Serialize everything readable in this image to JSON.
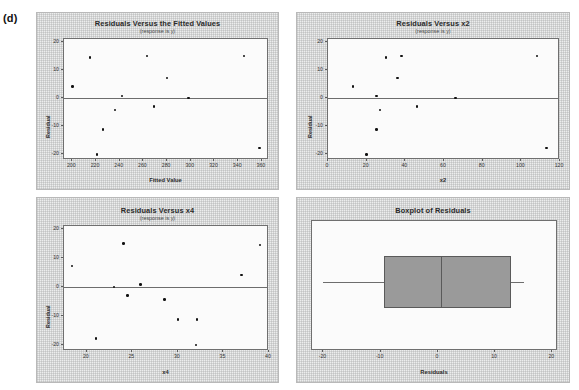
{
  "figure": {
    "label": "(d)"
  },
  "panels": [
    {
      "name": "residuals-vs-fitted",
      "title": "Residuals Versus the Fitted Values",
      "subtitle": "(response is y)",
      "xlabel": "Fitted Value",
      "ylabel": "Residual"
    },
    {
      "name": "residuals-vs-x2",
      "title": "Residuals Versus x2",
      "subtitle": "(response is y)",
      "xlabel": "x2",
      "ylabel": "Residual"
    },
    {
      "name": "residuals-vs-x4",
      "title": "Residuals Versus x4",
      "subtitle": "(response is y)",
      "xlabel": "x4",
      "ylabel": "Residual"
    },
    {
      "name": "boxplot-residuals",
      "title": "Boxplot of Residuals",
      "subtitle": "",
      "xlabel": "Residuals",
      "ylabel": ""
    }
  ],
  "chart_data": [
    {
      "type": "scatter",
      "title": "Residuals Versus the Fitted Values",
      "subtitle": "(response is y)",
      "xlabel": "Fitted Value",
      "ylabel": "Residual",
      "xlim": [
        193,
        366
      ],
      "ylim": [
        -22,
        21
      ],
      "xticks": [
        200,
        220,
        240,
        260,
        280,
        300,
        320,
        340,
        360
      ],
      "yticks": [
        -20,
        -10,
        0,
        10,
        20
      ],
      "grid": false,
      "reference_line": 0,
      "x": [
        200,
        215,
        221,
        226,
        236,
        242,
        263,
        269,
        280,
        298,
        345,
        358
      ],
      "y": [
        4.2,
        14.5,
        -20.0,
        -11.2,
        -4.3,
        0.8,
        15.0,
        -3.0,
        7.2,
        0.0,
        15.0,
        -17.8
      ]
    },
    {
      "type": "scatter",
      "title": "Residuals Versus x2",
      "subtitle": "(response is y)",
      "xlabel": "x2",
      "ylabel": "Residual",
      "xlim": [
        0,
        120
      ],
      "ylim": [
        -22,
        21
      ],
      "xticks": [
        0,
        20,
        40,
        60,
        80,
        100,
        120
      ],
      "yticks": [
        -20,
        -10,
        0,
        10,
        20
      ],
      "grid": false,
      "reference_line": 0,
      "x": [
        13,
        20,
        25,
        25,
        27,
        30,
        36,
        38,
        46,
        66,
        108,
        113
      ],
      "y": [
        4.2,
        -20.0,
        0.8,
        -11.2,
        -4.3,
        14.5,
        7.2,
        15.0,
        -3.0,
        0.0,
        15.0,
        -17.8
      ]
    },
    {
      "type": "scatter",
      "title": "Residuals Versus x4",
      "subtitle": "(response is y)",
      "xlabel": "x4",
      "ylabel": "Residual",
      "xlim": [
        17.5,
        40
      ],
      "ylim": [
        -22,
        21
      ],
      "xticks": [
        20,
        25,
        30,
        35,
        40
      ],
      "yticks": [
        -20,
        -10,
        0,
        10,
        20
      ],
      "grid": false,
      "reference_line": 0,
      "x": [
        18.4,
        21.0,
        23.0,
        24.0,
        24.5,
        25.9,
        28.5,
        30.0,
        32.0,
        32.1,
        37.0,
        39.0
      ],
      "y": [
        7.2,
        -17.8,
        0.0,
        15.0,
        -3.0,
        0.8,
        -4.3,
        -11.2,
        -20.0,
        -11.2,
        4.2,
        14.5
      ]
    },
    {
      "type": "boxplot",
      "title": "Boxplot of Residuals",
      "subtitle": "",
      "xlabel": "Residuals",
      "ylabel": "",
      "xlim": [
        -22,
        21
      ],
      "xticks": [
        -20,
        -10,
        0,
        10,
        20
      ],
      "grid": false,
      "orientation": "horizontal",
      "stats": {
        "min": -20.0,
        "q1": -9.5,
        "median": 0.5,
        "q3": 12.7,
        "max": 15.0
      }
    }
  ]
}
